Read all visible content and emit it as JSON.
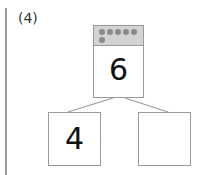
{
  "problem": {
    "label": "(4)",
    "whole": "6",
    "dot_count": 6,
    "parts": [
      "4",
      ""
    ]
  },
  "colors": {
    "border": "#9a9a9a",
    "header": "#d3d3d3",
    "dot": "#8a8a8a"
  }
}
